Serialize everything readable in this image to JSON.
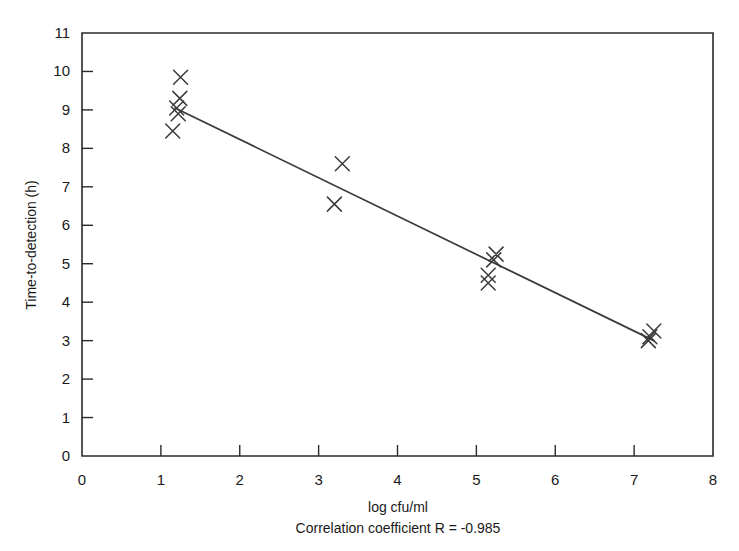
{
  "chart_data": {
    "type": "scatter",
    "title": "",
    "xlabel": "log cfu/ml",
    "ylabel": "Time-to-detection (h)",
    "annotation": "Correlation coefficient R = -0.985",
    "xlim": [
      0,
      8
    ],
    "ylim": [
      0,
      11
    ],
    "xticks": [
      0,
      1,
      2,
      3,
      4,
      5,
      6,
      7,
      8
    ],
    "yticks": [
      0,
      1,
      2,
      3,
      4,
      5,
      6,
      7,
      8,
      9,
      10,
      11
    ],
    "xtick_labels": [
      "0",
      "1",
      "2",
      "3",
      "4",
      "5",
      "6",
      "7",
      "8"
    ],
    "ytick_labels": [
      "0",
      "1",
      "2",
      "3",
      "4",
      "5",
      "6",
      "7",
      "8",
      "9",
      "10",
      "11"
    ],
    "grid": false,
    "legend": null,
    "marker_style": "x",
    "marker_color": "#3a3a3a",
    "line_color": "#3a3a3a",
    "correlation_r": -0.985,
    "points": [
      {
        "x": 1.25,
        "y": 9.85
      },
      {
        "x": 1.24,
        "y": 9.3
      },
      {
        "x": 1.2,
        "y": 9.05
      },
      {
        "x": 1.22,
        "y": 8.9
      },
      {
        "x": 1.15,
        "y": 8.45
      },
      {
        "x": 3.3,
        "y": 7.6
      },
      {
        "x": 3.2,
        "y": 6.55
      },
      {
        "x": 5.25,
        "y": 5.25
      },
      {
        "x": 5.22,
        "y": 5.1
      },
      {
        "x": 5.15,
        "y": 4.7
      },
      {
        "x": 5.15,
        "y": 4.5
      },
      {
        "x": 7.25,
        "y": 3.25
      },
      {
        "x": 7.2,
        "y": 3.1
      },
      {
        "x": 7.18,
        "y": 3.0
      }
    ],
    "trend_line": {
      "x_start": 1.18,
      "y_start": 9.05,
      "x_end": 7.25,
      "y_end": 3.0
    }
  },
  "axes": {
    "x_title": "log cfu/ml",
    "y_title": "Time-to-detection (h)"
  },
  "caption": {
    "correlation": "Correlation coefficient R = -0.985"
  }
}
